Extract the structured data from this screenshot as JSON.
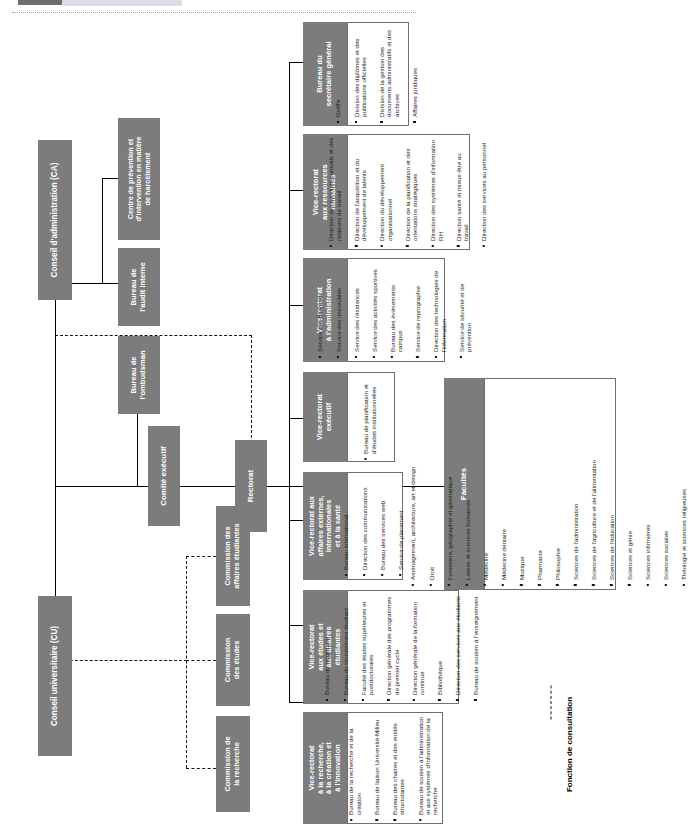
{
  "document": {
    "type": "organizational-chart",
    "orientation": "rotated-90-ccw",
    "language": "fr"
  },
  "legend": {
    "label": "Fonction de consultation",
    "line_style": "dashed"
  },
  "nodes": {
    "conseil_administration": "Conseil d'administration (CA)",
    "conseil_universitaire": "Conseil universitaire (CU)",
    "comite_executif": "Comité exécutif",
    "rectorat": "Rectorat",
    "centre_prevention": "Centre de prévention et\nd'intervention en matière\nde harcèlement",
    "bureau_audit": "Bureau de\nl'audit interne",
    "bureau_ombudsman": "Bureau de\nl'ombudsman",
    "commission_affaires_etudiantes": "Commission des\naffaires étudiantes",
    "commission_etudes": "Commission\ndes études",
    "commission_recherche": "Commission de\nla recherche"
  },
  "units": [
    {
      "id": "secretariat-general",
      "title": "Bureau du\nsecrétaire général",
      "items": [
        "Greffe",
        "Division des diplômes et des publications officielles",
        "Division de la gestion des documents administratifs et des archives",
        "Affaires juridiques"
      ]
    },
    {
      "id": "ressources-humaines",
      "title": "Vice-rectorat\naux ressources\nhumaines",
      "items": [
        "Direction des services-conseils et des relations de travail",
        "Direction de l'acquisition et du développement de talents",
        "Direction du développement organisationnel",
        "Direction de la planification et des orientations stratégiques",
        "Direction des systèmes d'information RH",
        "Direction santé et mieux-être au travail",
        "Direction des services au personnel"
      ]
    },
    {
      "id": "administration",
      "title": "Vice-rectorat\nà l'administration",
      "items": [
        "Service des finances",
        "Service des immeubles",
        "Service des résidences",
        "Service des activités sportives",
        "Bureau des événements campus",
        "Service de reprographie",
        "Direction des technologies de l'information",
        "Service de sécurité et de prévention"
      ]
    },
    {
      "id": "executif",
      "title": "Vice-rectorat\nexécutif",
      "items": [
        "Bureau de planification et d'études institutionnelles"
      ]
    },
    {
      "id": "affaires-externes",
      "title": "Vice-rectorat aux\naffaires externes,\ninternationales\net à la santé",
      "items": [
        "Bureau international",
        "Direction des communications",
        "Bureau des services web",
        "Service de placement"
      ]
    },
    {
      "id": "etudes-affaires-etudiantes",
      "title": "Vice-rectorat\naux études et\naux affaires\nétudiantes",
      "items": [
        "Bureau du registraire",
        "Bureau du recrutement étudiant",
        "Faculté des études supérieures et postdoctorales",
        "Direction générale des programmes de premier cycle",
        "Direction générale de la formation continue",
        "Bibliothèque",
        "Direction des services aux étudiants",
        "Bureau de soutien à l'enseignement"
      ]
    },
    {
      "id": "recherche",
      "title": "Vice-rectorat\nà la recherche,\nà la création et\nà l'innovation",
      "items": [
        "Bureau de la recherche et de la création",
        "Bureau de liaison Université-Milieu",
        "Bureau des chaires et des entités structurantes",
        "Bureau de soutien à l'administration et aux systèmes d'information de la recherche"
      ]
    },
    {
      "id": "facultes",
      "title": "Facultés",
      "items": [
        "Aménagement, architecture, art et design",
        "Droit",
        "Foresterie, géographie et géomatique",
        "Lettres et sciences humaines",
        "Médecine",
        "Médecine dentaire",
        "Musique",
        "Pharmacie",
        "Philosophie",
        "Sciences de l'administration",
        "Sciences de l'agriculture et de l'alimentation",
        "Sciences de l'éducation",
        "Sciences et génie",
        "Sciences infirmières",
        "Sciences sociales",
        "Théologie et sciences religieuses"
      ]
    }
  ],
  "colors": {
    "node_fill": "#7c7c7c",
    "node_text": "#ffffff",
    "list_border": "#6f6f6f",
    "connector": "#000000",
    "page_background": "#ffffff"
  }
}
